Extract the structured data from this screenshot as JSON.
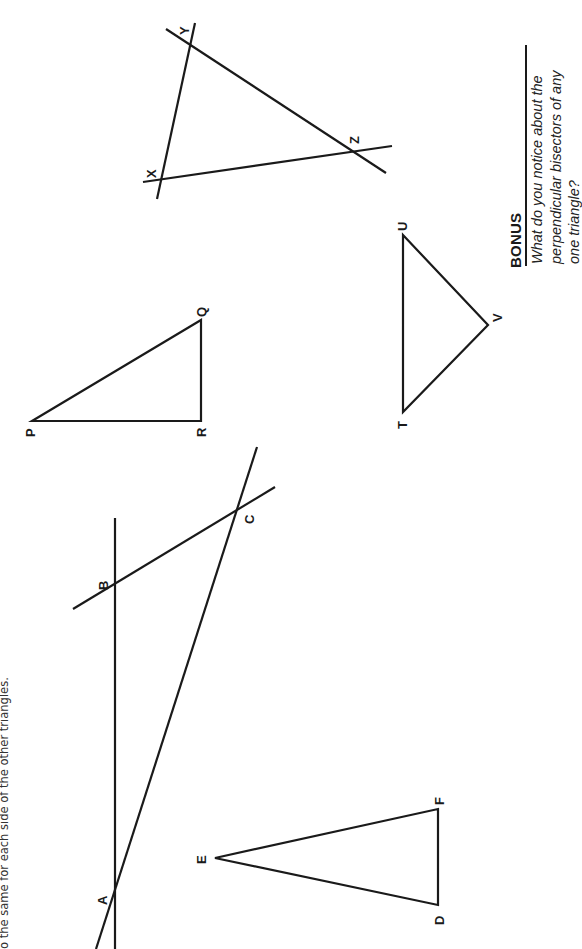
{
  "instruction_fragment": "o the same for each side of the other triangles.",
  "bonus": {
    "title": "BONUS",
    "lines": [
      "What do you notice about the",
      "perpendicular bisectors of any",
      "one triangle?"
    ]
  },
  "figures": {
    "abc": {
      "labels": {
        "A": "A",
        "B": "B",
        "C": "C"
      },
      "lines": [
        {
          "name": "line-ab",
          "x1": 115,
          "y1": 518,
          "x2": 115,
          "y2": 949
        },
        {
          "name": "line-ac",
          "x1": 257,
          "y1": 447,
          "x2": 96,
          "y2": 949
        },
        {
          "name": "line-bc",
          "x1": 73,
          "y1": 609,
          "x2": 275,
          "y2": 487
        }
      ]
    },
    "def": {
      "labels": {
        "D": "D",
        "E": "E",
        "F": "F"
      },
      "points": "215,858 438,809 438,905"
    },
    "pqr": {
      "labels": {
        "P": "P",
        "Q": "Q",
        "R": "R"
      },
      "points": "32,421 201,320 201,421"
    },
    "tuv": {
      "labels": {
        "T": "T",
        "U": "U",
        "V": "V"
      },
      "points": "403,412 403,235 488,325"
    },
    "xyz": {
      "labels": {
        "X": "X",
        "Y": "Y",
        "Z": "Z"
      },
      "lines": [
        {
          "name": "line-xy",
          "x1": 195,
          "y1": 23,
          "x2": 157,
          "y2": 199
        },
        {
          "name": "line-yz",
          "x1": 166,
          "y1": 29,
          "x2": 386,
          "y2": 173
        },
        {
          "name": "line-xz",
          "x1": 143,
          "y1": 182,
          "x2": 392,
          "y2": 146
        }
      ]
    }
  }
}
